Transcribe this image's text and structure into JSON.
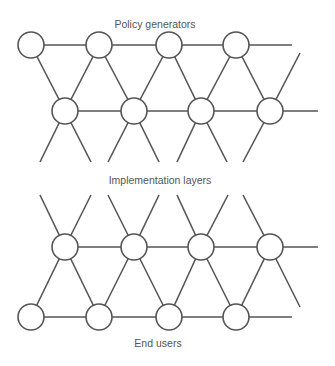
{
  "diagram": {
    "title_top": "Policy generators",
    "title_middle": "Implementation layers",
    "title_bottom": "End users",
    "stroke_color": "#555555",
    "node_radius": 13,
    "upper_network": {
      "top_row_nodes": [
        [
          31,
          45
        ],
        [
          99,
          45
        ],
        [
          169,
          45
        ],
        [
          236,
          45
        ]
      ],
      "bottom_row_nodes": [
        [
          65,
          111
        ],
        [
          134,
          111
        ],
        [
          201,
          111
        ],
        [
          270,
          111
        ]
      ]
    },
    "lower_network": {
      "top_row_nodes": [
        [
          65,
          247
        ],
        [
          134,
          247
        ],
        [
          201,
          247
        ],
        [
          270,
          247
        ]
      ],
      "bottom_row_nodes": [
        [
          31,
          317
        ],
        [
          99,
          317
        ],
        [
          169,
          317
        ],
        [
          236,
          317
        ]
      ]
    }
  }
}
